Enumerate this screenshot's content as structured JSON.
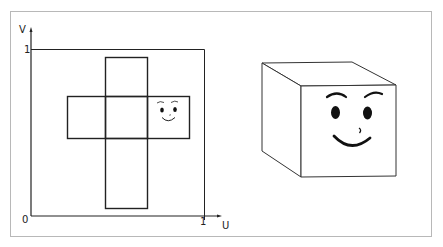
{
  "figure": {
    "uv_map": {
      "axis_v_label": "V",
      "axis_u_label": "U",
      "origin_label": "0",
      "v_max_label": "1",
      "u_max_label": "1",
      "net_type": "cube-cross-net",
      "faces": 6,
      "face_with_smiley": "right"
    },
    "cube": {
      "description": "3D cube with smiley face on front face"
    }
  },
  "colors": {
    "frame": "#b8b8b8",
    "lines": "#222222",
    "face": "#111111",
    "background": "#ffffff"
  }
}
